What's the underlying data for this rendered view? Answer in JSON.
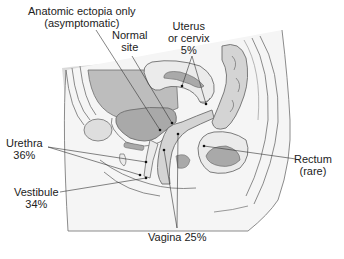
{
  "diagram": {
    "type": "anatomical-illustration",
    "colors": {
      "text": "#222222",
      "leader_line": "#333333",
      "dot": "#111111",
      "outline": "#6e6e6e",
      "tissue_light": "#ebebeb",
      "tissue_mid": "#d4d4d4",
      "tissue_dark": "#a9a9a9",
      "background_shade": "#c8c8c8"
    },
    "labels": {
      "ectopia": {
        "line1": "Anatomic ectopia only",
        "line2": "(asymptomatic)"
      },
      "normal": {
        "line1": "Normal",
        "line2": "site"
      },
      "uterus": {
        "line1": "Uterus",
        "line2": "or cervix",
        "line3": "5%"
      },
      "urethra": {
        "line1": "Urethra",
        "line2": "36%"
      },
      "vestibule": {
        "line1": "Vestibule",
        "line2": "34%"
      },
      "rectum": {
        "line1": "Rectum",
        "line2": "(rare)"
      },
      "vagina": {
        "line1": "Vagina 25%"
      }
    }
  }
}
